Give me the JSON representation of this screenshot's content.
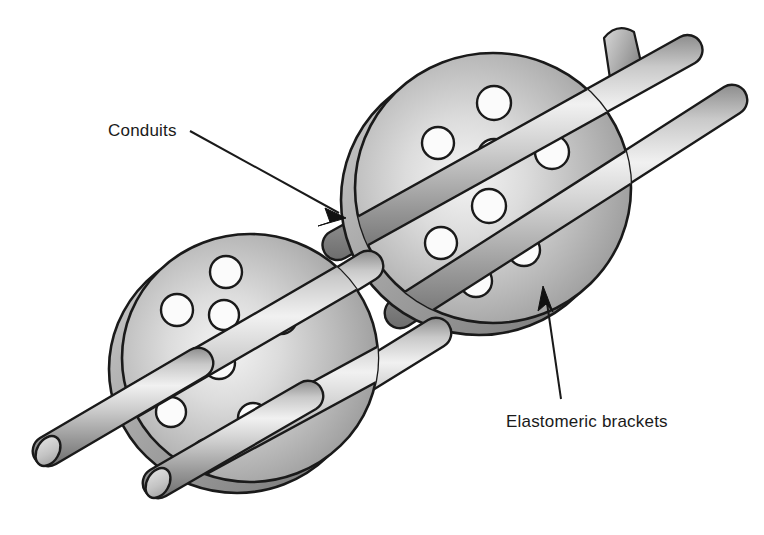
{
  "figure": {
    "background_color": "#ffffff",
    "outline_color": "#1a1a1a",
    "metal_light": "#f2f2f2",
    "metal_mid": "#b4b4b4",
    "metal_dark": "#6e6e6e",
    "hole_fill": "#fbfbfb"
  },
  "callouts": [
    {
      "id": "conduits",
      "label": "Conduits",
      "label_x": 108,
      "label_y": 136,
      "leader": {
        "x1": 190,
        "y1": 131,
        "x2": 341,
        "y2": 214
      },
      "arrow_tip": {
        "x": 346,
        "y": 218
      },
      "arrow_angle_deg": 29
    },
    {
      "id": "elastomeric-brackets",
      "label": "Elastomeric brackets",
      "label_x": 506,
      "label_y": 427,
      "leader": {
        "x1": 560,
        "y1": 398,
        "x2": 547,
        "y2": 295
      },
      "arrow_tip": {
        "x": 543,
        "y": 287
      },
      "arrow_angle_deg": -97
    }
  ],
  "brackets": [
    {
      "id": "upper-bracket",
      "name": "elastomeric-bracket-upper",
      "center_x": 493,
      "center_y": 188,
      "radius_x": 138,
      "radius_y": 135,
      "rim_offset_x": -14,
      "rim_offset_y": 12,
      "holes": [
        {
          "cx": 494,
          "cy": 103,
          "r": 17
        },
        {
          "cx": 438,
          "cy": 143,
          "r": 16
        },
        {
          "cx": 494,
          "cy": 155,
          "r": 16
        },
        {
          "cx": 552,
          "cy": 152,
          "r": 17
        },
        {
          "cx": 489,
          "cy": 206,
          "r": 17
        },
        {
          "cx": 441,
          "cy": 243,
          "r": 16
        },
        {
          "cx": 524,
          "cy": 250,
          "r": 16
        },
        {
          "cx": 476,
          "cy": 281,
          "r": 16
        }
      ]
    },
    {
      "id": "lower-bracket",
      "name": "elastomeric-bracket-lower",
      "center_x": 250,
      "center_y": 358,
      "radius_x": 128,
      "radius_y": 124,
      "rim_offset_x": -13,
      "rim_offset_y": 11,
      "holes": [
        {
          "cx": 226,
          "cy": 272,
          "r": 16
        },
        {
          "cx": 177,
          "cy": 310,
          "r": 16
        },
        {
          "cx": 224,
          "cy": 315,
          "r": 15
        },
        {
          "cx": 281,
          "cy": 318,
          "r": 16
        },
        {
          "cx": 219,
          "cy": 363,
          "r": 16
        },
        {
          "cx": 171,
          "cy": 412,
          "r": 15
        },
        {
          "cx": 253,
          "cy": 418,
          "r": 15
        },
        {
          "cx": 207,
          "cy": 454,
          "r": 15
        }
      ]
    }
  ],
  "conduits": [
    {
      "id": "conduit-upper",
      "name": "conduit-rod-upper",
      "x1": 36,
      "y1": 447,
      "x2": 671,
      "y2": 92,
      "thickness": 27
    },
    {
      "id": "conduit-lower",
      "name": "conduit-rod-lower",
      "x1": 148,
      "y1": 478,
      "x2": 716,
      "y2": 108,
      "thickness": 27
    }
  ],
  "conduit_stubs": [
    {
      "id": "stub-upper-right",
      "cx": 627,
      "cy": 55,
      "rx": 15,
      "ry": 24,
      "rot": 22
    }
  ]
}
